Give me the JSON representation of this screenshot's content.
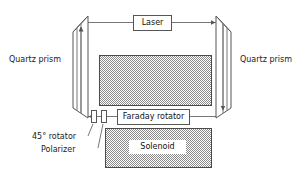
{
  "figure": {
    "type": "optical-setup-schematic",
    "background_color": "#ffffff",
    "line_color": "#555555",
    "hatch_fill_color": "#b4b4b4"
  },
  "labels": {
    "quartz_prism_left": "Quartz prism",
    "quartz_prism_right": "Quartz prism",
    "laser": "Laser",
    "faraday_rotator": "Faraday rotator",
    "solenoid": "Solenoid",
    "rotator_45": "45° rotator",
    "polarizer": "Polarizer"
  },
  "components": [
    {
      "name": "quartz-prism-left",
      "label": "Quartz prism",
      "kind": "prism"
    },
    {
      "name": "quartz-prism-right",
      "label": "Quartz prism",
      "kind": "prism"
    },
    {
      "name": "laser",
      "label": "Laser",
      "kind": "boxed-label"
    },
    {
      "name": "faraday-rotator",
      "label": "Faraday rotator",
      "kind": "boxed-label"
    },
    {
      "name": "solenoid",
      "label": "Solenoid",
      "kind": "hatched-block"
    },
    {
      "name": "upper-hatched-block",
      "label": "",
      "kind": "hatched-block"
    },
    {
      "name": "rotator-45",
      "label": "45° rotator",
      "kind": "optical-element"
    },
    {
      "name": "polarizer",
      "label": "Polarizer",
      "kind": "optical-element"
    }
  ]
}
